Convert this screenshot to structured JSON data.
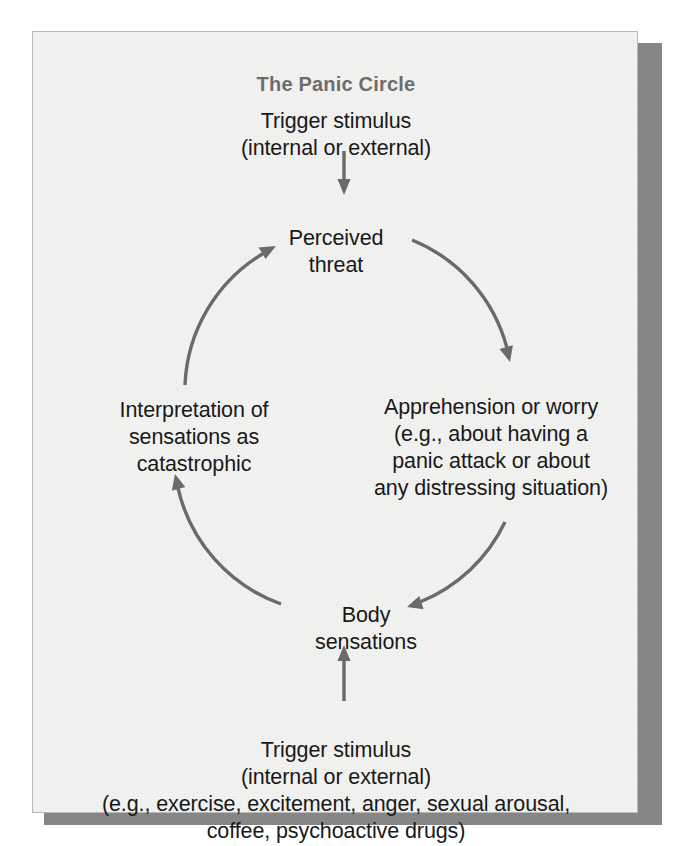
{
  "figure": {
    "title": "The Panic Circle",
    "title_color": "#6d6d6d",
    "panel_background": "#f2f2f1",
    "panel_border_color": "#b9b9b9",
    "shadow_color": "#868686",
    "text_color": "#191919",
    "arrow_color": "#6a6a6a"
  },
  "nodes": {
    "trigger_top": "Trigger stimulus\n(internal or external)",
    "perceived_threat": "Perceived\nthreat",
    "apprehension": "Apprehension or worry\n(e.g., about having a\npanic attack or about\nany distressing situation)",
    "interpretation": "Interpretation of\nsensations as\ncatastrophic",
    "body_sensations": "Body\nsensations",
    "trigger_bottom": "Trigger stimulus\n(internal or external)\n(e.g., exercise, excitement, anger, sexual arousal,\ncoffee, psychoactive drugs)"
  },
  "arrows": {
    "trigger_top_to_perceived_threat": "down-straight-arrow",
    "perceived_threat_to_apprehension": "clockwise-arc-top-right",
    "apprehension_to_body_sensations": "clockwise-arc-bottom-right",
    "body_sensations_to_interpretation": "clockwise-arc-bottom-left",
    "interpretation_to_perceived_threat": "clockwise-arc-top-left",
    "trigger_bottom_to_body_sensations": "up-straight-arrow"
  }
}
